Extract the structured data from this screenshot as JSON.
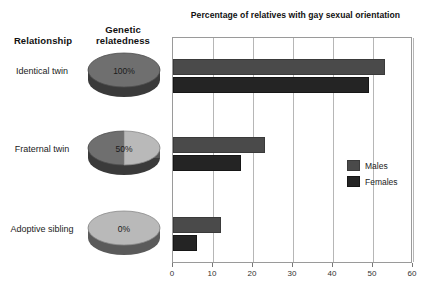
{
  "headers": {
    "relationship": "Relationship",
    "relatedness": "Genetic relatedness"
  },
  "rows": [
    {
      "label": "Identical twin",
      "relatedness_pct": "100%",
      "relatedness_value": 100
    },
    {
      "label": "Fraternal twin",
      "relatedness_pct": "50%",
      "relatedness_value": 50
    },
    {
      "label": "Adoptive sibling",
      "relatedness_pct": "0%",
      "relatedness_value": 0
    }
  ],
  "legend": {
    "items": [
      {
        "name": "Males",
        "color": "#4a4a4a"
      },
      {
        "name": "Females",
        "color": "#242424"
      }
    ]
  },
  "colors": {
    "males": "#4a4a4a",
    "females": "#242424",
    "pie_dark": "#6f6f6f",
    "pie_light": "#b9b9b9",
    "pie_edge": "#3a3a3a",
    "frame": "#9a9a9a",
    "grid": "#b6b6b6"
  },
  "chart_data": {
    "type": "bar",
    "orientation": "horizontal",
    "title": "Percentage of relatives with gay sexual orientation",
    "xlabel": "",
    "ylabel": "",
    "categories": [
      "Identical twin",
      "Fraternal twin",
      "Adoptive sibling"
    ],
    "series": [
      {
        "name": "Males",
        "values": [
          53,
          23,
          12
        ]
      },
      {
        "name": "Females",
        "values": [
          49,
          17,
          6
        ]
      }
    ],
    "xlim": [
      0,
      60
    ],
    "xticks": [
      0,
      10,
      20,
      30,
      40,
      50,
      60
    ],
    "xtick_labels": [
      "0",
      "10",
      "20",
      "30",
      "40",
      "50",
      "60"
    ],
    "grid": "vertical",
    "legend_position": "center-right"
  }
}
